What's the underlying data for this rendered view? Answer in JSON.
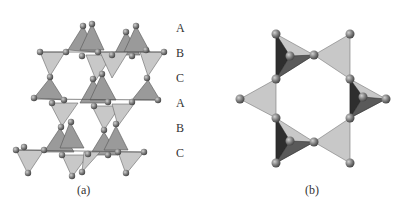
{
  "figure": {
    "panel_a": {
      "caption": "(a)",
      "layer_labels": [
        "A",
        "B",
        "C",
        "A",
        "B",
        "C"
      ]
    },
    "panel_b": {
      "caption": "(b)"
    },
    "colors": {
      "light_tetra": "#c4c4c4",
      "mid_tetra": "#8a8a8a",
      "dark_tetra": "#2e2e2e",
      "atom": "#7a7a7a"
    }
  }
}
